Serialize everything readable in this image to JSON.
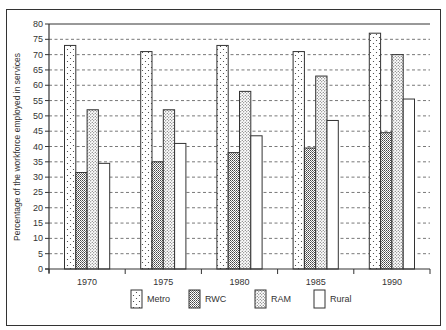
{
  "chart_data": {
    "type": "bar",
    "title": "",
    "xlabel": "",
    "ylabel": "Percentage of the workforce employed in services",
    "ylim": [
      0,
      80
    ],
    "ytick_step": 5,
    "yticks": [
      "0",
      "5",
      "10",
      "15",
      "20",
      "25",
      "30",
      "35",
      "40",
      "45",
      "50",
      "55",
      "60",
      "65",
      "70",
      "75",
      "80"
    ],
    "grid": true,
    "grid_style": "dashed-horizontal",
    "legend_position": "bottom",
    "categories": [
      "1970",
      "1975",
      "1980",
      "1985",
      "1990"
    ],
    "series": [
      {
        "name": "Metro",
        "pattern": "sparse-dots",
        "values": [
          73,
          71,
          73,
          71,
          77
        ]
      },
      {
        "name": "RWC",
        "pattern": "dense-dots",
        "values": [
          31.5,
          35,
          38,
          39.5,
          44.5
        ]
      },
      {
        "name": "RAM",
        "pattern": "checker-dots",
        "values": [
          52,
          52,
          58,
          63,
          70
        ]
      },
      {
        "name": "Rural",
        "pattern": "none",
        "values": [
          34.5,
          41,
          43.5,
          48.5,
          55.5
        ]
      }
    ]
  },
  "colors": {
    "ink": "#333333",
    "grid": "#555555",
    "background": "#ffffff"
  }
}
